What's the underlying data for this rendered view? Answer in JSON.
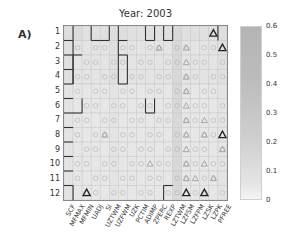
{
  "panel_label": "A)",
  "chart_data": {
    "type": "heatmap",
    "title": "Year: 2003",
    "xlabel": "",
    "ylabel": "",
    "x_categories": [
      "SCF",
      "MFMAX",
      "MFMIN",
      "UADJ",
      "SI",
      "UZTWM",
      "UZFWM",
      "UZK",
      "PCTIM",
      "ADIMP",
      "ZPERC",
      "REXP",
      "LZTWM",
      "LZFSM",
      "LZFPM",
      "LZSK",
      "LZPK",
      "PFREE"
    ],
    "y_categories": [
      "1",
      "2",
      "3",
      "4",
      "5",
      "6",
      "7",
      "8",
      "9",
      "10",
      "11",
      "12"
    ],
    "colorbar": {
      "min": 0,
      "max": 0.6,
      "ticks": [
        "0.6",
        "0.5",
        "0.4",
        "0.3",
        "0.2",
        "0.1",
        "0"
      ]
    },
    "values": [
      [
        0.2,
        0.22,
        0.18,
        0.18,
        0.18,
        0.2,
        0.2,
        0.18,
        0.18,
        0.18,
        0.18,
        0.18,
        0.25,
        0.18,
        0.18,
        0.18,
        0.18,
        0.2
      ],
      [
        0.18,
        0.15,
        0.15,
        0.15,
        0.15,
        0.18,
        0.15,
        0.15,
        0.15,
        0.15,
        0.15,
        0.15,
        0.25,
        0.15,
        0.15,
        0.15,
        0.15,
        0.18
      ],
      [
        0.18,
        0.15,
        0.15,
        0.15,
        0.15,
        0.18,
        0.15,
        0.15,
        0.15,
        0.15,
        0.15,
        0.15,
        0.25,
        0.15,
        0.15,
        0.15,
        0.15,
        0.18
      ],
      [
        0.18,
        0.15,
        0.15,
        0.15,
        0.15,
        0.18,
        0.15,
        0.15,
        0.15,
        0.15,
        0.15,
        0.15,
        0.25,
        0.15,
        0.15,
        0.15,
        0.15,
        0.18
      ],
      [
        0.15,
        0.12,
        0.12,
        0.12,
        0.12,
        0.15,
        0.12,
        0.12,
        0.12,
        0.12,
        0.12,
        0.12,
        0.25,
        0.12,
        0.12,
        0.12,
        0.12,
        0.15
      ],
      [
        0.15,
        0.12,
        0.12,
        0.12,
        0.12,
        0.15,
        0.12,
        0.12,
        0.12,
        0.12,
        0.12,
        0.12,
        0.25,
        0.12,
        0.12,
        0.12,
        0.12,
        0.15
      ],
      [
        0.15,
        0.12,
        0.12,
        0.12,
        0.12,
        0.15,
        0.12,
        0.12,
        0.12,
        0.12,
        0.12,
        0.12,
        0.25,
        0.12,
        0.12,
        0.12,
        0.12,
        0.15
      ],
      [
        0.15,
        0.12,
        0.12,
        0.12,
        0.12,
        0.15,
        0.12,
        0.12,
        0.12,
        0.12,
        0.12,
        0.12,
        0.25,
        0.12,
        0.12,
        0.12,
        0.12,
        0.15
      ],
      [
        0.15,
        0.12,
        0.12,
        0.12,
        0.12,
        0.15,
        0.12,
        0.12,
        0.12,
        0.12,
        0.12,
        0.12,
        0.25,
        0.12,
        0.12,
        0.12,
        0.12,
        0.15
      ],
      [
        0.15,
        0.12,
        0.12,
        0.12,
        0.12,
        0.15,
        0.12,
        0.12,
        0.12,
        0.12,
        0.12,
        0.12,
        0.25,
        0.12,
        0.12,
        0.12,
        0.12,
        0.15
      ],
      [
        0.15,
        0.12,
        0.12,
        0.12,
        0.12,
        0.15,
        0.12,
        0.12,
        0.12,
        0.12,
        0.12,
        0.12,
        0.25,
        0.12,
        0.12,
        0.12,
        0.12,
        0.15
      ],
      [
        0.15,
        0.12,
        0.12,
        0.12,
        0.12,
        0.15,
        0.12,
        0.12,
        0.12,
        0.12,
        0.12,
        0.12,
        0.25,
        0.12,
        0.12,
        0.12,
        0.12,
        0.15
      ]
    ],
    "markers": {
      "triangles_bold": [
        [
          1,
          16
        ],
        [
          12,
          2
        ],
        [
          12,
          13
        ],
        [
          12,
          15
        ],
        [
          8,
          17
        ],
        [
          2,
          17
        ]
      ],
      "triangles_faint": [
        [
          2,
          10
        ],
        [
          2,
          13
        ],
        [
          3,
          13
        ],
        [
          4,
          13
        ],
        [
          5,
          13
        ],
        [
          6,
          13
        ],
        [
          7,
          13
        ],
        [
          7,
          15
        ],
        [
          8,
          4
        ],
        [
          8,
          13
        ],
        [
          8,
          15
        ],
        [
          9,
          13
        ],
        [
          9,
          17
        ],
        [
          10,
          9
        ],
        [
          10,
          13
        ],
        [
          10,
          15
        ],
        [
          11,
          13
        ],
        [
          11,
          14
        ],
        [
          11,
          16
        ]
      ],
      "circles": "faint circles in most cells of rows 2-12"
    },
    "grid": true,
    "legend_position": "right colorbar"
  }
}
